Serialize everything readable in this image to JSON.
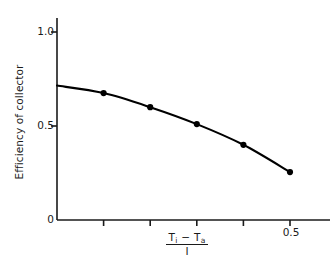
{
  "chart_data": {
    "type": "line",
    "title": "",
    "xlabel_numerator_left": "T",
    "xlabel_numerator_left_sub": "i",
    "xlabel_minus": "−",
    "xlabel_numerator_right": "T",
    "xlabel_numerator_right_sub": "a",
    "xlabel_denominator": "I",
    "ylabel": "Efficiency of collector",
    "xlim": [
      0,
      0.55
    ],
    "ylim": [
      0,
      1.08
    ],
    "grid": false,
    "legend": "none",
    "x_tick_values": [
      0,
      0.1,
      0.2,
      0.3,
      0.4,
      0.5
    ],
    "x_tick_labels": [
      "",
      "",
      "",
      "",
      "",
      "0.5"
    ],
    "y_tick_values": [
      0,
      0.5,
      1.0
    ],
    "y_tick_labels": [
      "0",
      "0.5",
      "1.0"
    ],
    "x": [
      0.1,
      0.2,
      0.3,
      0.4,
      0.5
    ],
    "values": [
      0.675,
      0.6,
      0.51,
      0.4,
      0.255
    ],
    "curve_intercept_y": 0.715,
    "marker": "filled-circle",
    "line_color": "#000000",
    "marker_color": "#000000",
    "axis_color": "#1a1a1a",
    "background_color": "#ffffff"
  },
  "axis_labels": {
    "y0": "0",
    "y05": "0.5",
    "y10": "1.0",
    "x05": "0.5"
  }
}
